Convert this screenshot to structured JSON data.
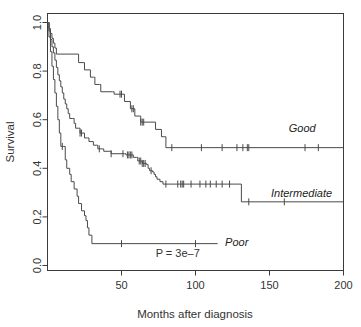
{
  "chart_data": {
    "type": "line",
    "title": "",
    "xlabel": "Months after diagnosis",
    "ylabel": "Survival",
    "xlim": [
      0,
      200
    ],
    "ylim": [
      0.0,
      1.0
    ],
    "xticks": [
      0,
      50,
      100,
      150,
      200
    ],
    "xtick_labels": [
      "",
      "50",
      "100",
      "150",
      "200"
    ],
    "yticks": [
      0.0,
      0.2,
      0.4,
      0.6,
      0.8,
      1.0
    ],
    "ytick_labels": [
      "0.0",
      "0.2",
      "0.4",
      "0.6",
      "0.8",
      "1.0"
    ],
    "grid": false,
    "legend_position": "inline-right-of-curves",
    "annotation": "P = 3e–7",
    "annotation_x": 88,
    "annotation_y": 0.035,
    "line_color": "#4a4a4a",
    "axis_color": "#3b3b3b",
    "series": [
      {
        "name": "Good",
        "label": "Good",
        "label_x": 163,
        "label_y": 0.565,
        "steps": [
          [
            0,
            1.0
          ],
          [
            1,
            0.975
          ],
          [
            2,
            0.955
          ],
          [
            3,
            0.935
          ],
          [
            4,
            0.915
          ],
          [
            5,
            0.895
          ],
          [
            6,
            0.87
          ],
          [
            20,
            0.87
          ],
          [
            21,
            0.835
          ],
          [
            24,
            0.835
          ],
          [
            25,
            0.805
          ],
          [
            28,
            0.805
          ],
          [
            29,
            0.775
          ],
          [
            31,
            0.775
          ],
          [
            32,
            0.745
          ],
          [
            35,
            0.745
          ],
          [
            36,
            0.715
          ],
          [
            44,
            0.715
          ],
          [
            45,
            0.705
          ],
          [
            51,
            0.705
          ],
          [
            52,
            0.675
          ],
          [
            55,
            0.675
          ],
          [
            56,
            0.645
          ],
          [
            58,
            0.645
          ],
          [
            59,
            0.615
          ],
          [
            62,
            0.615
          ],
          [
            63,
            0.59
          ],
          [
            72,
            0.59
          ],
          [
            73,
            0.56
          ],
          [
            76,
            0.56
          ],
          [
            77,
            0.53
          ],
          [
            79,
            0.53
          ],
          [
            80,
            0.485
          ],
          [
            200,
            0.485
          ]
        ],
        "censor_times": [
          49,
          50,
          57,
          58,
          63,
          64,
          65,
          84,
          104,
          118,
          128,
          132,
          135,
          136,
          174,
          183
        ]
      },
      {
        "name": "Intermediate",
        "label": "Intermediate",
        "label_x": 151,
        "label_y": 0.3,
        "steps": [
          [
            0,
            1.0
          ],
          [
            1,
            0.965
          ],
          [
            2,
            0.93
          ],
          [
            3,
            0.9
          ],
          [
            4,
            0.875
          ],
          [
            5,
            0.845
          ],
          [
            6,
            0.815
          ],
          [
            7,
            0.785
          ],
          [
            8,
            0.76
          ],
          [
            9,
            0.735
          ],
          [
            10,
            0.71
          ],
          [
            11,
            0.685
          ],
          [
            12,
            0.665
          ],
          [
            13,
            0.645
          ],
          [
            14,
            0.625
          ],
          [
            15,
            0.605
          ],
          [
            17,
            0.605
          ],
          [
            18,
            0.585
          ],
          [
            19,
            0.565
          ],
          [
            21,
            0.565
          ],
          [
            22,
            0.545
          ],
          [
            24,
            0.545
          ],
          [
            25,
            0.525
          ],
          [
            27,
            0.525
          ],
          [
            28,
            0.51
          ],
          [
            30,
            0.51
          ],
          [
            31,
            0.495
          ],
          [
            33,
            0.495
          ],
          [
            34,
            0.48
          ],
          [
            37,
            0.48
          ],
          [
            38,
            0.47
          ],
          [
            42,
            0.47
          ],
          [
            43,
            0.46
          ],
          [
            52,
            0.46
          ],
          [
            53,
            0.455
          ],
          [
            57,
            0.455
          ],
          [
            58,
            0.445
          ],
          [
            60,
            0.445
          ],
          [
            61,
            0.43
          ],
          [
            63,
            0.43
          ],
          [
            64,
            0.42
          ],
          [
            66,
            0.42
          ],
          [
            67,
            0.415
          ],
          [
            68,
            0.4
          ],
          [
            69,
            0.39
          ],
          [
            71,
            0.385
          ],
          [
            72,
            0.375
          ],
          [
            73,
            0.365
          ],
          [
            74,
            0.355
          ],
          [
            76,
            0.345
          ],
          [
            78,
            0.335
          ],
          [
            130,
            0.335
          ],
          [
            131,
            0.262
          ],
          [
            200,
            0.262
          ]
        ],
        "censor_times": [
          22,
          23,
          35,
          43,
          51,
          54,
          55,
          56,
          57,
          62,
          63,
          64,
          65,
          66,
          70,
          80,
          88,
          90,
          91,
          92,
          97,
          103,
          107,
          110,
          114,
          118,
          123,
          136,
          160
        ]
      },
      {
        "name": "Poor",
        "label": "Poor",
        "label_x": 120,
        "label_y": 0.095,
        "steps": [
          [
            0,
            1.0
          ],
          [
            1,
            0.94
          ],
          [
            2,
            0.88
          ],
          [
            3,
            0.82
          ],
          [
            4,
            0.765
          ],
          [
            5,
            0.71
          ],
          [
            6,
            0.655
          ],
          [
            7,
            0.6
          ],
          [
            8,
            0.545
          ],
          [
            9,
            0.49
          ],
          [
            11,
            0.49
          ],
          [
            12,
            0.435
          ],
          [
            13,
            0.4
          ],
          [
            15,
            0.375
          ],
          [
            16,
            0.345
          ],
          [
            18,
            0.315
          ],
          [
            20,
            0.285
          ],
          [
            21,
            0.255
          ],
          [
            23,
            0.225
          ],
          [
            25,
            0.205
          ],
          [
            26,
            0.185
          ],
          [
            27,
            0.155
          ],
          [
            28,
            0.125
          ],
          [
            30,
            0.09
          ],
          [
            115,
            0.09
          ]
        ],
        "censor_times": [
          10,
          50,
          100
        ]
      }
    ]
  }
}
